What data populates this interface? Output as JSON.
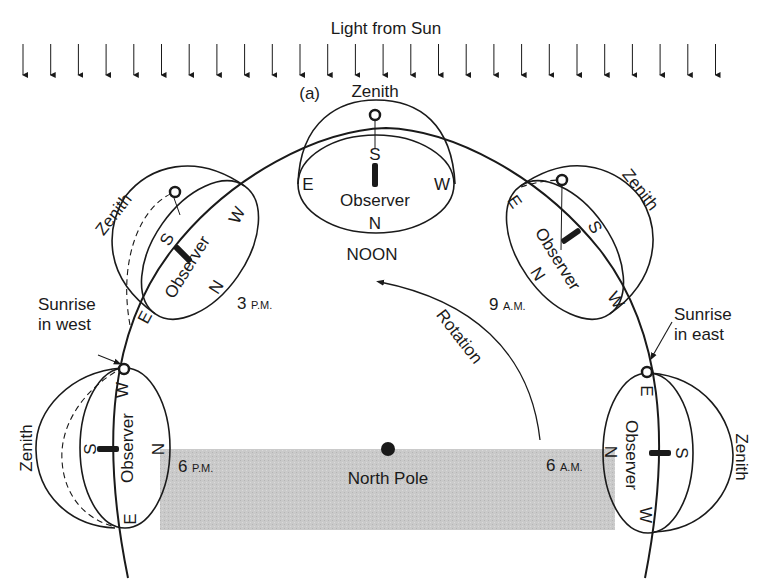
{
  "title": "Light from Sun",
  "panel_label": "(a)",
  "sun_rays": {
    "count": 26,
    "x_start": 23,
    "x_step": 27.7,
    "y_top": 44,
    "y_bottom": 75
  },
  "colors": {
    "ink": "#1a1a1a",
    "shadow": "#c8c8c8",
    "background": "#ffffff"
  },
  "pole": {
    "label": "North Pole"
  },
  "rotation": {
    "label": "Rotation"
  },
  "positions": {
    "noon": {
      "time_label": "NOON",
      "zenith": "Zenith",
      "observer": "Observer",
      "dirs": {
        "n": "N",
        "s": "S",
        "e": "E",
        "w": "W"
      }
    },
    "pm3": {
      "hour": "3",
      "ampm": "P.M.",
      "zenith": "Zenith",
      "observer": "Observer",
      "dirs": {
        "n": "N",
        "s": "S",
        "e": "E",
        "w": "W"
      }
    },
    "am9": {
      "hour": "9",
      "ampm": "A.M.",
      "zenith": "Zenith",
      "observer": "Observer",
      "dirs": {
        "n": "N",
        "s": "S",
        "e": "E",
        "w": "W"
      }
    },
    "pm6": {
      "hour": "6",
      "ampm": "P.M.",
      "zenith": "Zenith",
      "observer": "Observer",
      "callout_line1": "Sunrise",
      "callout_line2": "in west",
      "dirs": {
        "n": "N",
        "s": "S",
        "e": "E",
        "w": "W"
      }
    },
    "am6": {
      "hour": "6",
      "ampm": "A.M.",
      "zenith": "Zenith",
      "observer": "Observer",
      "callout_line1": "Sunrise",
      "callout_line2": "in east",
      "dirs": {
        "n": "N",
        "s": "S",
        "e": "E",
        "w": "W"
      }
    }
  }
}
